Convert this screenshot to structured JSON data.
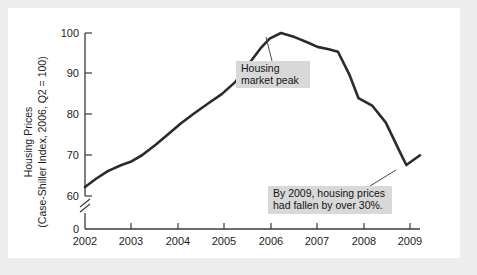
{
  "figure": {
    "background": "#ededed",
    "plate_background": "#ffffff",
    "line_color": "#2b2b2b",
    "annotation_box_color": "#d8d8d8"
  },
  "chart_data": {
    "type": "line",
    "title": "",
    "xlabel": "",
    "ylabel": "Housing Prices",
    "ylabel_sub": "(Case-Shiller Index, 2006, Q2 = 100)",
    "grid": false,
    "legend": "none",
    "axis_break_y": true,
    "xlim": [
      2002.0,
      2009.35
    ],
    "ylim": [
      58.5,
      101.5
    ],
    "yticks": [
      0,
      60,
      70,
      80,
      90,
      100
    ],
    "ytick_labels": [
      "0",
      "60",
      "70",
      "80",
      "90",
      "100"
    ],
    "xticks": [
      2002,
      2003,
      2004,
      2005,
      2006,
      2007,
      2008,
      2009
    ],
    "xtick_labels": [
      "2002",
      "2003",
      "2004",
      "2005",
      "2006",
      "2007",
      "2008",
      "2009"
    ],
    "series": [
      {
        "name": "Case-Shiller Housing Price Index",
        "x": [
          2002.0,
          2002.25,
          2002.5,
          2002.8,
          2003.0,
          2003.25,
          2003.55,
          2003.85,
          2004.1,
          2004.4,
          2004.7,
          2005.0,
          2005.3,
          2005.6,
          2005.85,
          2006.05,
          2006.3,
          2006.6,
          2006.9,
          2007.1,
          2007.35,
          2007.55,
          2007.8,
          2008.0,
          2008.3,
          2008.6,
          2008.9,
          2009.05,
          2009.35
        ],
        "y": [
          62.2,
          64.3,
          66.1,
          67.6,
          68.4,
          70.0,
          72.6,
          75.4,
          77.8,
          80.3,
          82.7,
          85.0,
          88.0,
          92.5,
          96.2,
          98.6,
          100.0,
          99.0,
          97.6,
          96.6,
          96.0,
          95.4,
          89.8,
          84.0,
          82.2,
          78.0,
          71.0,
          67.6,
          70.0
        ]
      }
    ],
    "annotations": [
      {
        "id": "peak",
        "text_lines": [
          "Housing",
          "market peak"
        ],
        "points_to_x": 2006.3,
        "points_to_y": 100.0
      },
      {
        "id": "decline",
        "text_lines": [
          "By 2009, housing prices",
          "had fallen by over 30%."
        ],
        "points_to_x": 2009.05,
        "points_to_y": 67.6
      }
    ]
  }
}
